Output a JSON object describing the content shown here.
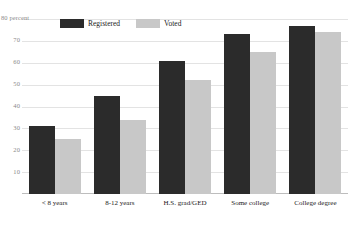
{
  "chart_data": {
    "type": "bar",
    "title": "",
    "xlabel": "",
    "ylabel": "80 percent",
    "ylim": [
      0,
      80
    ],
    "yticks": [
      80,
      70,
      60,
      50,
      40,
      30,
      20,
      10
    ],
    "ytick_labels": [
      "80 percent",
      "70",
      "60",
      "50",
      "40",
      "30",
      "20",
      "10"
    ],
    "grid": true,
    "legend_position": "top-left-inline",
    "categories": [
      "< 8 years",
      "8-12 years",
      "H.S. grad/GED",
      "Some college",
      "College degree"
    ],
    "series": [
      {
        "name": "Registered",
        "color": "#2b2b2b",
        "values": [
          31,
          45,
          61,
          73,
          77
        ]
      },
      {
        "name": "Voted",
        "color": "#c8c8c8",
        "values": [
          25,
          34,
          52,
          65,
          74
        ]
      }
    ]
  },
  "colors": {
    "background": "#ffffff",
    "gridline": "#e3e3e3",
    "baseline": "#bdbdbd",
    "tick_text": "#8a8a8a",
    "label_text": "#1a1a1a",
    "registered": "#2b2b2b",
    "voted": "#c8c8c8"
  }
}
